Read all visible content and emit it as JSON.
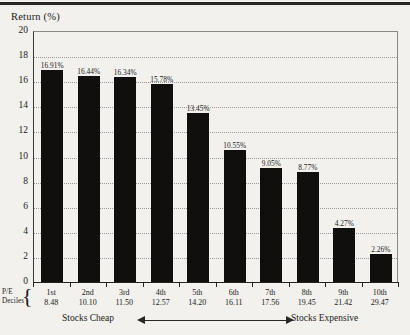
{
  "chart_data": {
    "type": "bar",
    "title": "Return (%)",
    "ylabel": "Return (%)",
    "xlabel": "P/E Deciles",
    "ylim": [
      0,
      20
    ],
    "yticks": [
      20,
      18,
      16,
      14,
      12,
      10,
      8,
      6,
      4,
      2,
      0
    ],
    "grid": true,
    "legend": false,
    "categories": [
      "1st",
      "2nd",
      "3rd",
      "4th",
      "5th",
      "6th",
      "7th",
      "8th",
      "9th",
      "10th"
    ],
    "values": [
      16.91,
      16.44,
      16.34,
      15.78,
      13.45,
      10.55,
      9.05,
      8.77,
      4.27,
      2.26
    ],
    "bar_labels": [
      "16.91%",
      "16.44%",
      "16.34%",
      "15.78%",
      "13.45%",
      "10.55%",
      "9.05%",
      "8.77%",
      "4.27%",
      "2.26%"
    ],
    "secondary_axis_label": "P/E Deciles",
    "secondary_values": [
      "8.48",
      "10.10",
      "11.50",
      "12.57",
      "14.20",
      "16.11",
      "17.56",
      "19.45",
      "21.42",
      "29.47"
    ],
    "annotations": {
      "left": "Stocks Cheap",
      "right": "Stocks Expensive"
    },
    "colors": {
      "bar": "#100f0d",
      "background": "#f2f1ee",
      "grid": "#9a9792",
      "axis": "#27241f",
      "text": "#1c1a18"
    }
  },
  "axis": {
    "pe_line1": "P/E",
    "pe_line2": "Deciles"
  }
}
